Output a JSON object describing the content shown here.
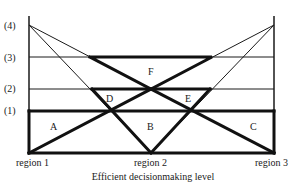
{
  "diagram": {
    "levels": [
      {
        "label": "(4)",
        "y": 25
      },
      {
        "label": "(3)",
        "y": 57
      },
      {
        "label": "(2)",
        "y": 89
      },
      {
        "label": "(1)",
        "y": 111
      }
    ],
    "regions": [
      {
        "label": "region 1",
        "x": 29
      },
      {
        "label": "region 2",
        "x": 151
      },
      {
        "label": "region 3",
        "x": 274
      }
    ],
    "areas": {
      "A": "A",
      "B": "B",
      "C": "C",
      "D": "D",
      "E": "E",
      "F": "F"
    },
    "x_axis_title": "Efficient decisionmaking level"
  }
}
